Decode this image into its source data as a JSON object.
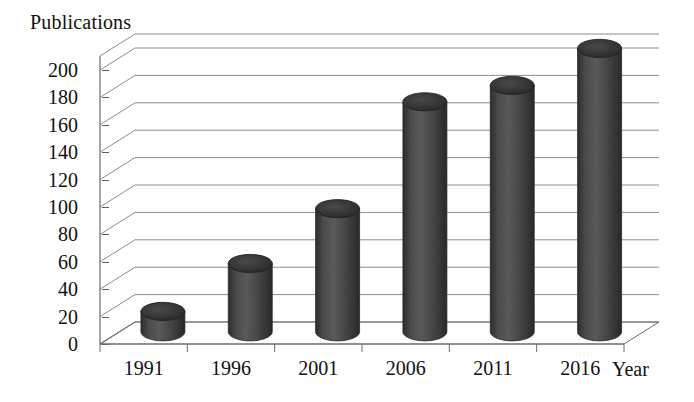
{
  "chart_data": {
    "type": "bar",
    "title": "",
    "subtitle": "",
    "ylabel": "Publications",
    "xlabel": "Year",
    "categories": [
      "1991",
      "1996",
      "2001",
      "2006",
      "2011",
      "2016"
    ],
    "values": [
      15,
      50,
      90,
      168,
      180,
      207
    ],
    "ylim": [
      0,
      200
    ],
    "ytick_step": 20,
    "yticks": [
      "200",
      "180",
      "160",
      "140",
      "120",
      "100",
      "80",
      "60",
      "40",
      "20",
      "0"
    ],
    "ytick_values": [
      200,
      180,
      160,
      140,
      120,
      100,
      80,
      60,
      40,
      20,
      0
    ],
    "grid": true,
    "grid_orientation": "horizontal",
    "legend": false,
    "legend_position": "none",
    "style": "3d-cylinder",
    "series": [
      {
        "name": "Publications",
        "values": [
          15,
          50,
          90,
          168,
          180,
          207
        ]
      }
    ],
    "annotations": []
  },
  "colors": {
    "bar_fill": "#4a4a4a",
    "bar_fill_light": "#6e6e6e",
    "bar_fill_dark": "#2e2e2e",
    "bar_top": "#3a3a3a",
    "axis_line": "#6a6a6a",
    "grid_line": "#8c8c8c",
    "background": "#ffffff",
    "text": "#111111"
  }
}
